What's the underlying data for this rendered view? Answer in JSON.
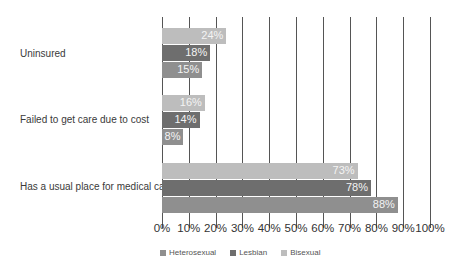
{
  "chart_data": {
    "type": "bar",
    "orientation": "horizontal",
    "title": "",
    "xlabel": "",
    "ylabel": "",
    "xlim": [
      0,
      100
    ],
    "grid": true,
    "legend_position": "bottom",
    "categories": [
      "Uninsured",
      "Failed to get care due to cost",
      "Has a usual place for medical care"
    ],
    "series": [
      {
        "name": "Bisexual",
        "color": "#bdbdbd",
        "values": [
          24,
          16,
          73
        ],
        "labels": [
          "24%",
          "16%",
          "73%"
        ]
      },
      {
        "name": "Lesbian",
        "color": "#6e6e6e",
        "values": [
          18,
          14,
          78
        ],
        "labels": [
          "18%",
          "14%",
          "78%"
        ]
      },
      {
        "name": "Heterosexual",
        "color": "#8f8f8f",
        "values": [
          15,
          8,
          88
        ],
        "labels": [
          "15%",
          "8%",
          "88%"
        ]
      }
    ],
    "tick_labels": [
      "0%",
      "10%",
      "20%",
      "30%",
      "40%",
      "50%",
      "60%",
      "70%",
      "80%",
      "90%",
      "100%"
    ],
    "legend": [
      "Heterosexual",
      "Lesbian",
      "Bisexual"
    ]
  }
}
